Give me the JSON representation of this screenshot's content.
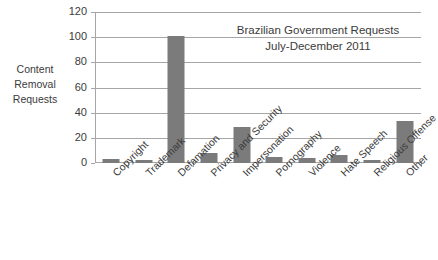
{
  "chart_data": {
    "type": "bar",
    "title": "Brazilian Government Requests July-December 2011",
    "title_line1": "Brazilian Government Requests",
    "title_line2": "July-December 2011",
    "xlabel": "",
    "ylabel": "Content Removal Requests",
    "ylabel_line1": "Content",
    "ylabel_line2": "Removal",
    "ylabel_line3": "Requests",
    "categories": [
      "Copyright",
      "Trademark",
      "Defamation",
      "Privacy and Security",
      "Impersonation",
      "Pornography",
      "Violence",
      "Hate Speech",
      "Religious Offense",
      "Other"
    ],
    "values": [
      3,
      2,
      101,
      8,
      29,
      5,
      4,
      6,
      2,
      33
    ],
    "ylim": [
      0,
      120
    ],
    "yticks": [
      0,
      20,
      40,
      60,
      80,
      100,
      120
    ],
    "ytick_labels": [
      "0",
      "20",
      "40",
      "60",
      "80",
      "100",
      "120"
    ],
    "grid": true,
    "legend": false,
    "bar_color": "#7b7b7b",
    "axis_color": "#a6a6a6",
    "text_color": "#3b3b3b",
    "background": "#ffffff"
  }
}
